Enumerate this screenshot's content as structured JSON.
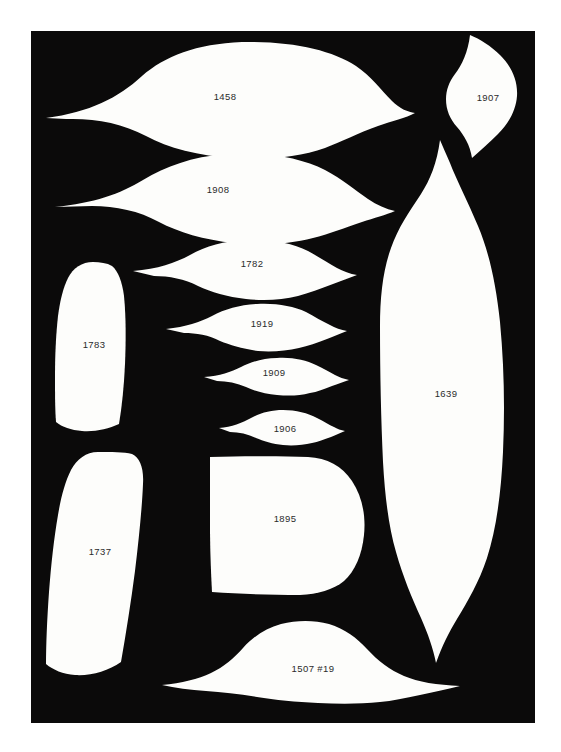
{
  "figure": {
    "background_color": "#ffffff",
    "panel_color": "#0b0a0a",
    "silhouette_color": "#fdfdfb",
    "label_color": "#2b2b2b",
    "panel": {
      "x": 31,
      "y": 31,
      "width": 504,
      "height": 692
    }
  },
  "artifacts": [
    {
      "id": "1458",
      "label": "1458",
      "shape": "pointed-oval-biface",
      "label_x": 225,
      "label_y": 97
    },
    {
      "id": "1907",
      "label": "1907",
      "shape": "pointed-leaf-right",
      "label_x": 488,
      "label_y": 98
    },
    {
      "id": "1908",
      "label": "1908",
      "shape": "pointed-oval-biface",
      "label_x": 218,
      "label_y": 190
    },
    {
      "id": "1782",
      "label": "1782",
      "shape": "pointed-oval-biface",
      "label_x": 252,
      "label_y": 264
    },
    {
      "id": "1919",
      "label": "1919",
      "shape": "pointed-oval-biface",
      "label_x": 262,
      "label_y": 324
    },
    {
      "id": "1909",
      "label": "1909",
      "shape": "pointed-oval-biface",
      "label_x": 274,
      "label_y": 373
    },
    {
      "id": "1906",
      "label": "1906",
      "shape": "pointed-oval-biface",
      "label_x": 285,
      "label_y": 429
    },
    {
      "id": "1639",
      "label": "1639",
      "shape": "large-vertical-lens",
      "label_x": 446,
      "label_y": 394
    },
    {
      "id": "1783",
      "label": "1783",
      "shape": "rounded-tapered-blade",
      "label_x": 94,
      "label_y": 345
    },
    {
      "id": "1737",
      "label": "1737",
      "shape": "rounded-tapered-blade",
      "label_x": 100,
      "label_y": 552
    },
    {
      "id": "1895",
      "label": "1895",
      "shape": "d-shaped-scraper",
      "label_x": 285,
      "label_y": 519
    },
    {
      "id": "1507",
      "label": "1507  #19",
      "shape": "broad-low-mound",
      "label_x": 313,
      "label_y": 669
    }
  ]
}
